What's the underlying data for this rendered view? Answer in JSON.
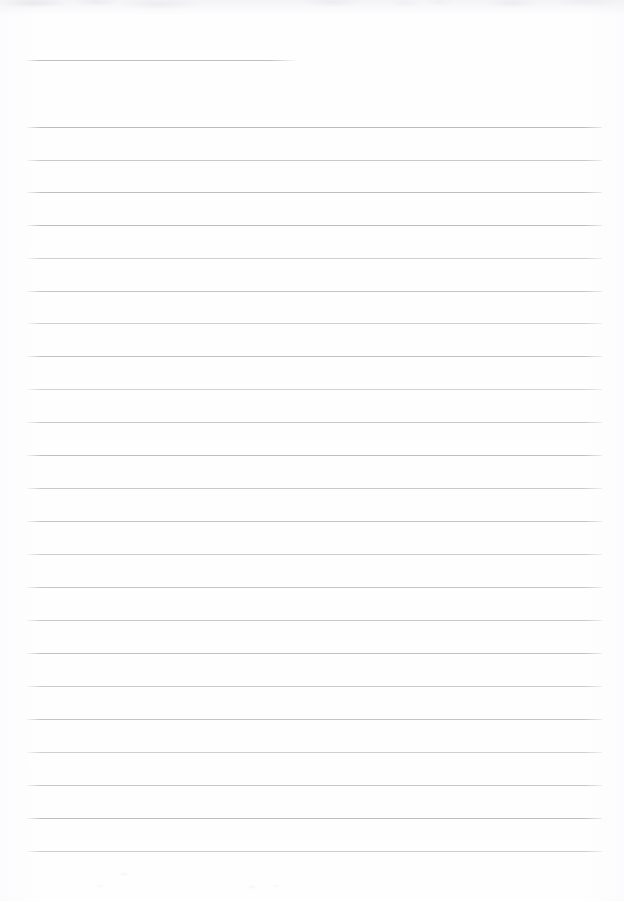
{
  "page": {
    "kind": "scanned-ruled-notebook-page",
    "width": 624,
    "height": 901,
    "background_color": "#fefeff",
    "rule_color": "#bcbcc0",
    "has_visible_text": false,
    "text_content": "",
    "margins": {
      "left": 27,
      "right": 22,
      "top": 60,
      "bottom": 51
    }
  },
  "header_rule": {
    "name": "short-header-rule",
    "y": 60,
    "x_start": 27,
    "x_end": 296,
    "width": 269,
    "opacity": 0.95
  },
  "body_rules": {
    "count": 23,
    "x_start": 27,
    "x_end": 602,
    "width": 575,
    "spacing": 32.9,
    "first_y": 127,
    "last_y": 851,
    "lines": [
      {
        "index": 1,
        "y": 127,
        "opacity": 1.0
      },
      {
        "index": 2,
        "y": 160,
        "opacity": 0.8
      },
      {
        "index": 3,
        "y": 192,
        "opacity": 0.95
      },
      {
        "index": 4,
        "y": 225,
        "opacity": 1.0
      },
      {
        "index": 5,
        "y": 258,
        "opacity": 0.72
      },
      {
        "index": 6,
        "y": 291,
        "opacity": 0.86
      },
      {
        "index": 7,
        "y": 323,
        "opacity": 0.7
      },
      {
        "index": 8,
        "y": 356,
        "opacity": 0.9
      },
      {
        "index": 9,
        "y": 389,
        "opacity": 0.66
      },
      {
        "index": 10,
        "y": 422,
        "opacity": 0.82
      },
      {
        "index": 11,
        "y": 455,
        "opacity": 0.94
      },
      {
        "index": 12,
        "y": 488,
        "opacity": 0.78
      },
      {
        "index": 13,
        "y": 521,
        "opacity": 0.88
      },
      {
        "index": 14,
        "y": 554,
        "opacity": 0.74
      },
      {
        "index": 15,
        "y": 587,
        "opacity": 0.86
      },
      {
        "index": 16,
        "y": 620,
        "opacity": 0.8
      },
      {
        "index": 17,
        "y": 653,
        "opacity": 0.92
      },
      {
        "index": 18,
        "y": 686,
        "opacity": 0.76
      },
      {
        "index": 19,
        "y": 719,
        "opacity": 0.88
      },
      {
        "index": 20,
        "y": 752,
        "opacity": 0.7
      },
      {
        "index": 21,
        "y": 785,
        "opacity": 0.84
      },
      {
        "index": 22,
        "y": 818,
        "opacity": 0.96
      },
      {
        "index": 23,
        "y": 851,
        "opacity": 0.74
      }
    ]
  }
}
